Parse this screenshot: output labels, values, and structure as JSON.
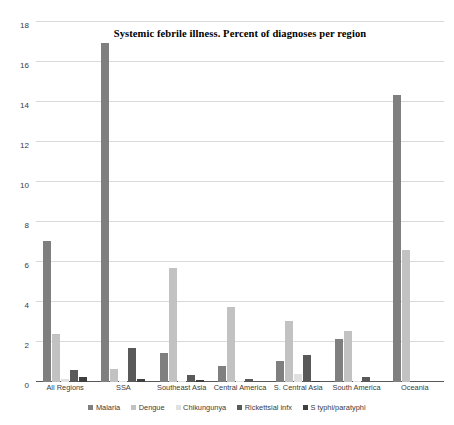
{
  "chart_data": {
    "type": "bar",
    "title": "Systemic febrile illness. Percent of diagnoses per region",
    "subtitle": "",
    "xlabel": "",
    "ylabel": "",
    "ylim": [
      0,
      18
    ],
    "y_ticks": [
      0,
      2,
      4,
      6,
      8,
      10,
      12,
      14,
      16,
      18
    ],
    "grid": true,
    "legend_position": "bottom",
    "categories": [
      "All Regions",
      "SSA",
      "Southeast Asia",
      "Central America",
      "S. Central Asia",
      "South America",
      "Oceania"
    ],
    "series": [
      {
        "name": "Malaria",
        "color": "#7f7f7f",
        "values": [
          7.05,
          16.95,
          1.45,
          0.8,
          1.05,
          2.15,
          14.35
        ]
      },
      {
        "name": "Dengue",
        "color": "#c2c2c2",
        "values": [
          2.4,
          0.65,
          5.7,
          3.75,
          3.05,
          2.55,
          6.6
        ]
      },
      {
        "name": "Chikungunya",
        "color": "#e0e0e0",
        "values": [
          0.15,
          0.05,
          0.05,
          0.05,
          0.4,
          0.05,
          0.0
        ]
      },
      {
        "name": "Rickettsial infx",
        "color": "#595959",
        "values": [
          0.6,
          1.7,
          0.35,
          0.15,
          1.35,
          0.25,
          0.05
        ]
      },
      {
        "name": "S typhi/paratyphi",
        "color": "#3f3f3f",
        "values": [
          0.25,
          0.15,
          0.1,
          0.0,
          0.05,
          0.0,
          0.0
        ]
      }
    ]
  }
}
